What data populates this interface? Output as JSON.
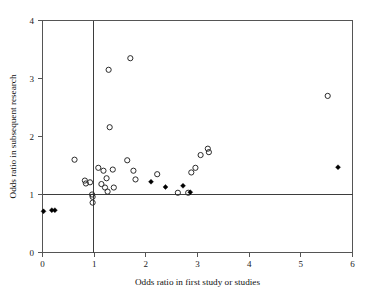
{
  "chart_data": {
    "type": "scatter",
    "title": "",
    "xlabel": "Odds ratio in first study or studies",
    "ylabel": "Odds ratio in subsequent research",
    "xlim": [
      0,
      6
    ],
    "ylim": [
      0,
      4
    ],
    "xticks": [
      0,
      1,
      2,
      3,
      4,
      5,
      6
    ],
    "yticks": [
      0,
      1,
      2,
      3,
      4
    ],
    "xticklabels": [
      "0",
      "1",
      "2",
      "3",
      "4",
      "5",
      "6"
    ],
    "yticklabels": [
      "0",
      "1",
      "2",
      "3",
      "4"
    ],
    "grid": false,
    "legend": "none",
    "reference_lines": [
      {
        "orientation": "vertical",
        "value": 1,
        "label": "no effect in first study"
      },
      {
        "orientation": "horizontal",
        "value": 1,
        "label": "no effect in subsequent research"
      }
    ],
    "series": [
      {
        "name": "Open circles",
        "marker": "open-circle",
        "color": "#2b2b2b",
        "points": [
          [
            0.62,
            1.6
          ],
          [
            0.82,
            1.24
          ],
          [
            0.84,
            1.19
          ],
          [
            0.92,
            1.21
          ],
          [
            0.96,
            1.0
          ],
          [
            0.97,
            0.96
          ],
          [
            0.97,
            0.86
          ],
          [
            1.08,
            1.46
          ],
          [
            1.14,
            1.18
          ],
          [
            1.18,
            1.41
          ],
          [
            1.21,
            1.12
          ],
          [
            1.24,
            1.28
          ],
          [
            1.26,
            1.05
          ],
          [
            1.28,
            3.15
          ],
          [
            1.3,
            2.16
          ],
          [
            1.36,
            1.43
          ],
          [
            1.38,
            1.12
          ],
          [
            1.64,
            1.59
          ],
          [
            1.7,
            3.35
          ],
          [
            1.76,
            1.41
          ],
          [
            1.8,
            1.26
          ],
          [
            2.22,
            1.35
          ],
          [
            2.62,
            1.03
          ],
          [
            2.82,
            1.03
          ],
          [
            2.88,
            1.38
          ],
          [
            2.96,
            1.46
          ],
          [
            3.06,
            1.68
          ],
          [
            3.2,
            1.79
          ],
          [
            3.22,
            1.73
          ],
          [
            5.52,
            2.7
          ]
        ]
      },
      {
        "name": "Filled diamonds",
        "marker": "filled-diamond",
        "color": "#000000",
        "points": [
          [
            0.02,
            0.71
          ],
          [
            0.18,
            0.73
          ],
          [
            0.24,
            0.73
          ],
          [
            2.1,
            1.22
          ],
          [
            2.38,
            1.13
          ],
          [
            2.72,
            1.15
          ],
          [
            2.86,
            1.04
          ],
          [
            5.72,
            1.47
          ]
        ]
      }
    ]
  },
  "axes": {
    "x_title": "Odds ratio in first study or studies",
    "y_title": "Odds ratio in subsequent research"
  }
}
